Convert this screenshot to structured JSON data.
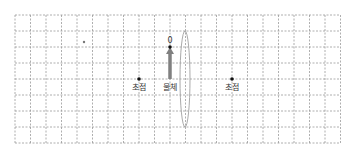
{
  "diagram": {
    "title": "",
    "grid": {
      "x0": 15,
      "y0": 15,
      "cols": 21,
      "rows": 8,
      "cell_w": 15.5,
      "cell_h": 16,
      "color": "#9a9a9a"
    },
    "labels": {
      "focal_left": "초점",
      "focal_right": "초점",
      "object": "물체",
      "object_top_marker": "0"
    },
    "points": {
      "stray_dot": {
        "x": 84,
        "y": 42
      },
      "focal_left": {
        "x": 139,
        "y": 79
      },
      "focal_right": {
        "x": 232,
        "y": 79
      },
      "object_top": {
        "x": 170,
        "y": 47
      }
    },
    "object_arrow": {
      "x": 170,
      "y_top": 47,
      "y_bottom": 79,
      "color": "#808080"
    },
    "lens": {
      "cx": 185,
      "cy": 79,
      "rx": 5,
      "ry": 48,
      "color": "#a0a0a0",
      "type": "convex"
    },
    "colors": {
      "dot": "#111111",
      "text": "#333333"
    }
  }
}
